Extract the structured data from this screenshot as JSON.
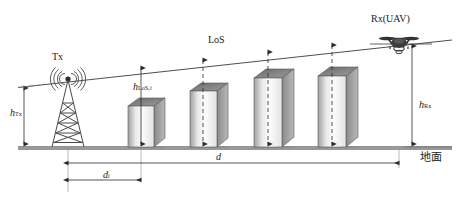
{
  "diagram": {
    "ground_label": "地面",
    "labels": {
      "tx": "Tx",
      "rx": "Rx(UAV)",
      "los": "LoS",
      "h_los_base": "h",
      "h_los_sub": "LoS,",
      "h_los_sub_i": "i",
      "h_tx_base": "h",
      "h_tx_sub": "Tx",
      "h_rx_base": "h",
      "h_rx_sub": "Rx",
      "d": "d",
      "d_i_base": "d",
      "d_i_sub": "i"
    },
    "colors": {
      "line": "#3a3a3a",
      "ground": "#9a9a9a",
      "building_front_light": "#fbfbfb",
      "building_front_dark": "#9e9e9e",
      "building_side": "#8d8d8d",
      "building_top": "#6e6e6e",
      "text": "#1a1a1a"
    },
    "icons": {
      "tx": "radio-tower-icon",
      "rx": "quadcopter-drone-icon"
    },
    "buildings": [
      {
        "name": "building-1",
        "x": 128,
        "width": 26,
        "height": 42,
        "depth": 11
      },
      {
        "name": "building-2",
        "x": 190,
        "width": 27,
        "height": 57,
        "depth": 11
      },
      {
        "name": "building-3",
        "x": 254,
        "width": 28,
        "height": 70,
        "depth": 12
      },
      {
        "name": "building-4",
        "x": 318,
        "width": 28,
        "height": 72,
        "depth": 12
      }
    ],
    "geometry": {
      "ground_y": 148,
      "tx_antenna_x": 68,
      "tx_antenna_y": 79,
      "rx_x": 399,
      "rx_y": 43,
      "los_start_x": 18,
      "los_start_y": 87,
      "los_end_x": 452,
      "los_end_y": 40
    },
    "dimensions": [
      {
        "name": "h-Tx",
        "orientation": "vertical",
        "label": "h_Tx"
      },
      {
        "name": "h-Rx",
        "orientation": "vertical",
        "label": "h_Rx"
      },
      {
        "name": "h-LoS-i",
        "orientation": "vertical",
        "label": "h_LoS,i"
      },
      {
        "name": "d",
        "orientation": "horizontal",
        "label": "d"
      },
      {
        "name": "d-i",
        "orientation": "horizontal",
        "label": "d_i"
      }
    ]
  }
}
